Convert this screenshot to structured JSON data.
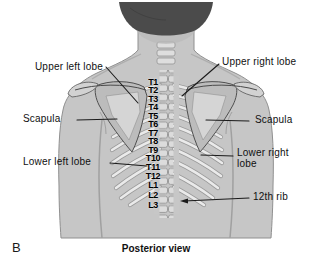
{
  "figure": {
    "panel_letter": "B",
    "caption": "Posterior view"
  },
  "callouts": {
    "upper_left_lobe": "Upper left lobe",
    "upper_right_lobe": "Upper right lobe",
    "scapula_left": "Scapula",
    "scapula_right": "Scapula",
    "lower_left_lobe": "Lower left lobe",
    "lower_right_lobe": "Lower right lobe",
    "twelfth_rib": "12th rib"
  },
  "vertebrae": [
    "T1",
    "T2",
    "T3",
    "T4",
    "T5",
    "T6",
    "T7",
    "T8",
    "T9",
    "T10",
    "T11",
    "T12",
    "L1",
    "L2",
    "L3"
  ],
  "colors": {
    "skin": "#c6c6c6",
    "hair": "#4b4b4b",
    "bone_light": "#eaeaea",
    "scapula": "#bcbcbc",
    "leader_line": "#1b1b1b"
  }
}
